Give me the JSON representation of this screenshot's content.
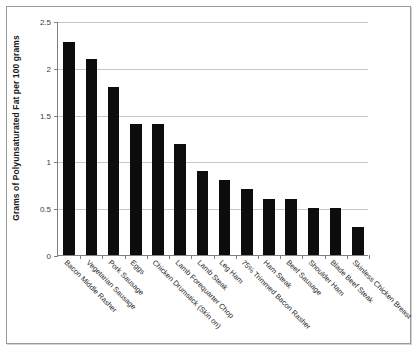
{
  "chart_data": {
    "type": "bar",
    "title": "",
    "xlabel": "",
    "ylabel": "Grams of Polyunsaturated Fat per 100 grams",
    "ylim": [
      0,
      2.5
    ],
    "yticks": [
      "0",
      "0.5",
      "1",
      "1.5",
      "2",
      "2.5"
    ],
    "ytick_values": [
      0,
      0.5,
      1,
      1.5,
      2,
      2.5
    ],
    "grid": true,
    "legend": "none",
    "bar_color": "#0d0d0d",
    "categories": [
      "Bacon Middle Rasher",
      "Vegetarian Sausage",
      "Pork Sausage",
      "Eggs",
      "Chicken Drumstick (Skin on)",
      "Lamb Forequarter Chop",
      "Lamb Steak",
      "Leg Ham",
      "75% Trimmed Bacon Rasher",
      "Ham Steak",
      "Beef Sausage",
      "Shoulder Ham",
      "Blade Beef Steak",
      "Skinless Chicken Breast"
    ],
    "values": [
      2.28,
      2.09,
      1.79,
      1.4,
      1.4,
      1.19,
      0.9,
      0.8,
      0.7,
      0.6,
      0.6,
      0.5,
      0.5,
      0.3
    ]
  }
}
